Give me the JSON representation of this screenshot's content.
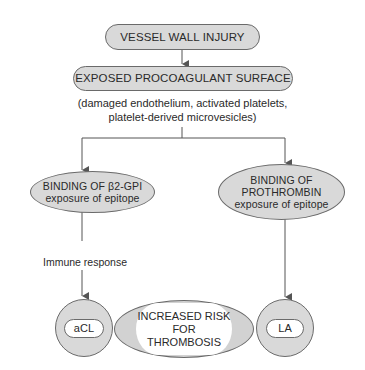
{
  "diagram": {
    "top_box": {
      "label": "VESSEL WALL INJURY"
    },
    "surface_box": {
      "label": "EXPOSED PROCOAGULANT SURFACE"
    },
    "surface_note": {
      "line1": "(damaged endothelium, activated platelets,",
      "line2": "platelet-derived microvesicles)"
    },
    "left_branch": {
      "line1": "BINDING OF β2-GPI",
      "line2": "exposure of epitope"
    },
    "right_branch": {
      "line1": "BINDING OF",
      "line2": "PROTHROMBIN",
      "line3": "exposure of epitope"
    },
    "edge_label": "Immune response",
    "left_outcome": {
      "label": "aCL"
    },
    "right_outcome": {
      "label": "LA"
    },
    "center_outcome": {
      "line1": "INCREASED RISK",
      "line2": "FOR",
      "line3": "THROMBOSIS"
    },
    "colors": {
      "node_fill": "#d9d9d9",
      "stroke": "#6a6a6a",
      "inner_fill": "#ffffff",
      "text": "#2a2a2a"
    }
  }
}
